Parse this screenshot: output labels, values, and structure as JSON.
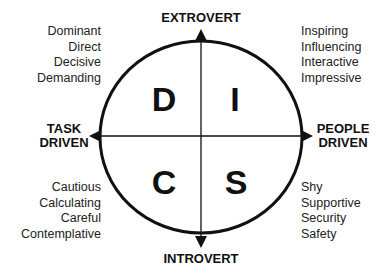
{
  "axes": {
    "top": "EXTROVERT",
    "bottom": "INTROVERT",
    "left": [
      "TASK",
      "DRIVEN"
    ],
    "right": [
      "PEOPLE",
      "DRIVEN"
    ]
  },
  "quadrants": {
    "d": {
      "letter": "D",
      "traits": [
        "Dominant",
        "Direct",
        "Decisive",
        "Demanding"
      ]
    },
    "i": {
      "letter": "I",
      "traits": [
        "Inspiring",
        "Influencing",
        "Interactive",
        "Impressive"
      ]
    },
    "c": {
      "letter": "C",
      "traits": [
        "Cautious",
        "Calculating",
        "Careful",
        "Contemplative"
      ]
    },
    "s": {
      "letter": "S",
      "traits": [
        "Shy",
        "Supportive",
        "Security",
        "Safety"
      ]
    }
  },
  "colors": {
    "ink": "#111111",
    "background": "#ffffff"
  }
}
